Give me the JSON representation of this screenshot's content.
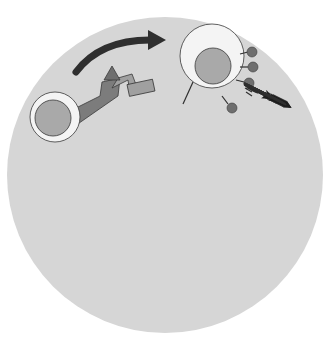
{
  "diagram": {
    "colors": {
      "background": "#ffffff",
      "outer_circle": "#d6d6d6",
      "cell_body": "#f4f4f4",
      "nucleus": "#a9a9a9",
      "receptor_dark": "#7c7c7c",
      "receptor_light": "#a0a0a0",
      "antigen": "#6e6e6e",
      "arrow_dark": "#2f2f2f",
      "outline": "#3a3a3a",
      "text": "#333333"
    },
    "labels": {
      "inhibition": "inhibition",
      "neoplastic_cell_line1": "neoplastic",
      "neoplastic_cell_line2": "cell",
      "sheds_antigen_line1": "sheds",
      "sheds_antigen_line2": "antigen",
      "antibody": "antibody",
      "plasma_cell_line1": "plasma",
      "plasma_cell_line2": "cell",
      "help": "help",
      "class2_line1": "class II",
      "class2_line2": "MHC+",
      "class2_line3": "processed",
      "class2_line4": "antigen",
      "apc": "APC",
      "t_cell_top": "T",
      "b_cell": "B",
      "t_cell_bottom": "T"
    },
    "nodes": [
      {
        "id": "neoplastic-cell",
        "label": "neoplastic cell"
      },
      {
        "id": "t-cell-top",
        "label": "T"
      },
      {
        "id": "antibody",
        "label": "antibody"
      },
      {
        "id": "plasma-cell",
        "label": "plasma cell"
      },
      {
        "id": "b-cell",
        "label": "B"
      },
      {
        "id": "t-cell-bottom",
        "label": "T"
      },
      {
        "id": "apc",
        "label": "APC"
      },
      {
        "id": "shed-antigen",
        "label": "sheds antigen"
      }
    ],
    "edges": [
      {
        "from": "t-cell-top",
        "to": "neoplastic-cell",
        "label": "inhibition"
      },
      {
        "from": "neoplastic-cell",
        "to": "shed-antigen",
        "label": "sheds antigen"
      },
      {
        "from": "shed-antigen",
        "to": "b-cell",
        "label": ""
      },
      {
        "from": "shed-antigen",
        "to": "apc",
        "label": ""
      },
      {
        "from": "apc",
        "to": "t-cell-bottom",
        "label": "class II MHC+ processed antigen"
      },
      {
        "from": "t-cell-bottom",
        "to": "b-cell",
        "label": "help"
      },
      {
        "from": "b-cell",
        "to": "plasma-cell",
        "label": ""
      },
      {
        "from": "plasma-cell",
        "to": "antibody",
        "label": ""
      },
      {
        "from": "antibody",
        "to": "neoplastic-cell",
        "label": ""
      }
    ]
  }
}
